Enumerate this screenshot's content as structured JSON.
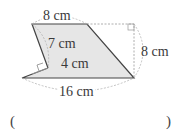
{
  "figure": {
    "shape": "composite quadrilateral (trapezoid with notch)",
    "fill_color": "#e6e6e6",
    "stroke_color": "#444444",
    "labels": {
      "top": "8 cm",
      "left_slant": "7 cm",
      "inner_perpendicular": "4 cm",
      "right_height": "8 cm",
      "bottom": "16 cm"
    }
  },
  "answer": {
    "open_paren": "(",
    "close_paren": ")",
    "blank": ""
  }
}
